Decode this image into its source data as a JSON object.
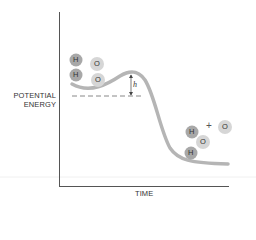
{
  "diagram": {
    "type": "energy-profile",
    "y_axis_label_line1": "POTENTIAL",
    "y_axis_label_line2": "ENERGY",
    "x_axis_label": "TIME",
    "barrier_label": "h",
    "plus_sign": "+",
    "reactants": [
      {
        "symbol": "H",
        "cx": 76,
        "cy": 60
      },
      {
        "symbol": "H",
        "cx": 76,
        "cy": 75
      },
      {
        "symbol": "O",
        "cx": 97,
        "cy": 64
      },
      {
        "symbol": "O",
        "cx": 98,
        "cy": 80
      }
    ],
    "products": [
      {
        "symbol": "H",
        "cx": 192,
        "cy": 132
      },
      {
        "symbol": "O",
        "cx": 203,
        "cy": 142
      },
      {
        "symbol": "H",
        "cx": 191,
        "cy": 153
      },
      {
        "symbol": "O",
        "cx": 225,
        "cy": 127
      }
    ],
    "colors": {
      "axis": "#555555",
      "curve": "#b5b5b5",
      "hydrogen": "#a8a8a8",
      "oxygen": "#d6d6d6",
      "dashed": "#888888",
      "text": "#333333"
    }
  }
}
